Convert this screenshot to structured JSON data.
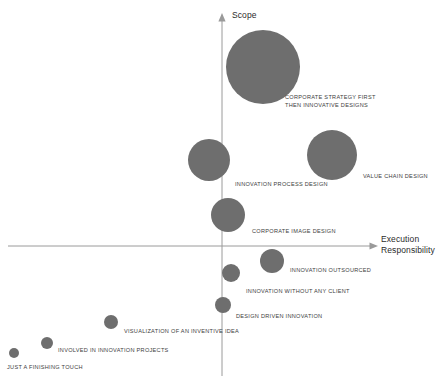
{
  "chart_data": {
    "type": "scatter",
    "title": "",
    "xlabel": "Execution Responsibility",
    "ylabel": "Scope",
    "xlim": [
      -2.6,
      3.1
    ],
    "ylim": [
      -2.4,
      3.1
    ],
    "grid": false,
    "legend": null,
    "axis_style": "crossed-arrows",
    "bubble_color": "#6e6e6e",
    "axis_color": "#9a9a9a",
    "points": [
      {
        "label": "CORPORATE STRATEGY FIRST\nTHEN INNOVATIVE DESIGNS",
        "x": 0.68,
        "y": 2.21,
        "size": 37,
        "cx": 263,
        "cy": 67,
        "r": 37,
        "label_x": 285,
        "label_y": 94,
        "label_align": "left"
      },
      {
        "label": "VALUE CHAIN DESIGN",
        "x": 1.72,
        "y": 1.32,
        "size": 25,
        "cx": 332,
        "cy": 155,
        "r": 25,
        "label_x": 363,
        "label_y": 173,
        "label_align": "left"
      },
      {
        "label": "INNOVATION PROCESS DESIGN",
        "x": -0.21,
        "y": 1.18,
        "size": 21,
        "cx": 209,
        "cy": 160,
        "r": 21,
        "label_x": 235,
        "label_y": 181,
        "label_align": "left"
      },
      {
        "label": "CORPORATE IMAGE DESIGN",
        "x": 0.16,
        "y": 0.61,
        "size": 17,
        "cx": 228,
        "cy": 215,
        "r": 17,
        "label_x": 252,
        "label_y": 228,
        "label_align": "left"
      },
      {
        "label": "INNOVATION OUTSOURCED",
        "x": 1.07,
        "y": -0.24,
        "size": 12,
        "cx": 272,
        "cy": 261,
        "r": 12,
        "label_x": 290,
        "label_y": 267,
        "label_align": "left"
      },
      {
        "label": "INNOVATION WITHOUT ANY CLIENT",
        "x": 0.23,
        "y": -0.53,
        "size": 9,
        "cx": 231,
        "cy": 273,
        "r": 9,
        "label_x": 246,
        "label_y": 288,
        "label_align": "left"
      },
      {
        "label": "DESIGN DRIVEN INNOVATION",
        "x": 0.03,
        "y": -1.22,
        "size": 8,
        "cx": 223,
        "cy": 305,
        "r": 8,
        "label_x": 236,
        "label_y": 313,
        "label_align": "left"
      },
      {
        "label": "VISUALIZATION OF AN INVENTIVE IDEA",
        "x": -2.08,
        "y": -1.58,
        "size": 7,
        "cx": 111,
        "cy": 322,
        "r": 7,
        "label_x": 124,
        "label_y": 328,
        "label_align": "left"
      },
      {
        "label": "INVOLVED IN INNOVATION PROJECTS",
        "x": -2.44,
        "y": -1.96,
        "size": 6,
        "cx": 47,
        "cy": 343,
        "r": 6,
        "label_x": 58,
        "label_y": 347,
        "label_align": "left"
      },
      {
        "label": "JUST A FINISHING TOUCH",
        "x": -2.56,
        "y": -2.22,
        "size": 5,
        "cx": 14,
        "cy": 353,
        "r": 5,
        "label_x": 7,
        "label_y": 364,
        "label_align": "left"
      }
    ]
  },
  "axes": {
    "y_axis_label": "Scope",
    "x_axis_label": "Execution\nResponsibility"
  }
}
